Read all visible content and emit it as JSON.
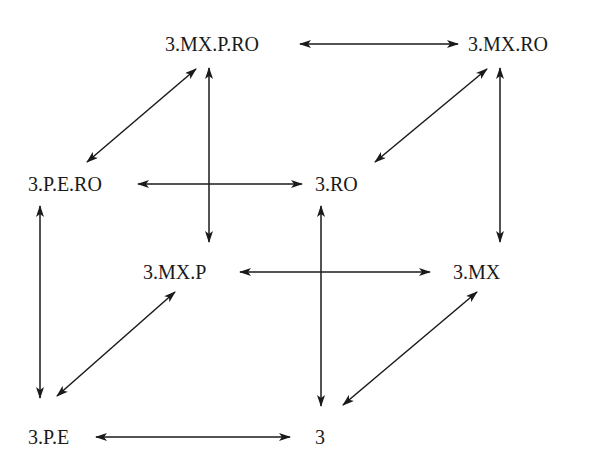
{
  "diagram": {
    "type": "lattice-cube",
    "nodes": [
      {
        "id": "n_mxpro",
        "label": "3.MX.P.RO",
        "x": 165,
        "y": 32
      },
      {
        "id": "n_mxro",
        "label": "3.MX.RO",
        "x": 468,
        "y": 32
      },
      {
        "id": "n_pero",
        "label": "3.P.E.RO",
        "x": 28,
        "y": 172
      },
      {
        "id": "n_ro",
        "label": "3.RO",
        "x": 315,
        "y": 172
      },
      {
        "id": "n_mxp",
        "label": "3.MX.P",
        "x": 143,
        "y": 260
      },
      {
        "id": "n_mx",
        "label": "3.MX",
        "x": 453,
        "y": 260
      },
      {
        "id": "n_pe",
        "label": "3.P.E",
        "x": 28,
        "y": 425
      },
      {
        "id": "n_3",
        "label": "3",
        "x": 315,
        "y": 425
      }
    ],
    "edges": [
      {
        "from": "3.MX.P.RO",
        "to": "3.MX.RO",
        "direction": "both",
        "x1": 300,
        "y1": 44,
        "x2": 458,
        "y2": 44
      },
      {
        "from": "3.MX.P.RO",
        "to": "3.P.E.RO",
        "direction": "both",
        "x1": 196,
        "y1": 69,
        "x2": 87,
        "y2": 162
      },
      {
        "from": "3.MX.P.RO",
        "to": "3.MX.P",
        "direction": "both",
        "x1": 209,
        "y1": 68,
        "x2": 209,
        "y2": 242
      },
      {
        "from": "3.MX.RO",
        "to": "3.RO",
        "direction": "both",
        "x1": 487,
        "y1": 69,
        "x2": 375,
        "y2": 162
      },
      {
        "from": "3.MX.RO",
        "to": "3.MX",
        "direction": "both",
        "x1": 500,
        "y1": 68,
        "x2": 500,
        "y2": 242
      },
      {
        "from": "3.P.E.RO",
        "to": "3.RO",
        "direction": "both",
        "x1": 138,
        "y1": 184,
        "x2": 302,
        "y2": 184
      },
      {
        "from": "3.P.E.RO",
        "to": "3.P.E",
        "direction": "both",
        "x1": 40,
        "y1": 206,
        "x2": 40,
        "y2": 398
      },
      {
        "from": "3.RO",
        "to": "3",
        "direction": "both",
        "x1": 321,
        "y1": 206,
        "x2": 321,
        "y2": 406
      },
      {
        "from": "3.MX.P",
        "to": "3.MX",
        "direction": "both",
        "x1": 240,
        "y1": 272,
        "x2": 430,
        "y2": 272
      },
      {
        "from": "3.MX.P",
        "to": "3.P.E",
        "direction": "both",
        "x1": 175,
        "y1": 292,
        "x2": 57,
        "y2": 396
      },
      {
        "from": "3.MX",
        "to": "3",
        "direction": "both",
        "x1": 477,
        "y1": 292,
        "x2": 343,
        "y2": 405
      },
      {
        "from": "3.P.E",
        "to": "3",
        "direction": "both",
        "x1": 96,
        "y1": 437,
        "x2": 290,
        "y2": 437
      }
    ],
    "colors": {
      "line": "#1a1a1a",
      "background": "#ffffff"
    }
  }
}
